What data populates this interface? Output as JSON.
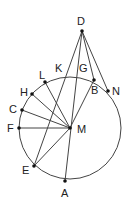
{
  "diagram": {
    "colors": {
      "stroke": "#444444",
      "point": "#111111",
      "label": "#222222"
    },
    "circle": {
      "center": "M",
      "cx": 70,
      "cy": 128,
      "r": 51
    },
    "points": {
      "D": {
        "x": 82,
        "y": 31,
        "label": "D"
      },
      "M": {
        "x": 70,
        "y": 128,
        "label": "M"
      },
      "B": {
        "x": 94,
        "y": 80,
        "label": "B"
      },
      "N": {
        "x": 108,
        "y": 91,
        "label": "N"
      },
      "L": {
        "x": 45,
        "y": 82,
        "label": "L"
      },
      "H": {
        "x": 32,
        "y": 94,
        "label": "H"
      },
      "C": {
        "x": 22,
        "y": 110,
        "label": "C"
      },
      "F": {
        "x": 19,
        "y": 128,
        "label": "F"
      },
      "E": {
        "x": 34,
        "y": 166,
        "label": "E"
      },
      "A": {
        "x": 65,
        "y": 181,
        "label": "A"
      },
      "K": {
        "label": "K"
      },
      "G": {
        "label": "G"
      }
    },
    "segments": [
      "DE",
      "DA",
      "DB",
      "DN",
      "BM",
      "MH",
      "ML",
      "MC",
      "MF",
      "ME"
    ]
  }
}
